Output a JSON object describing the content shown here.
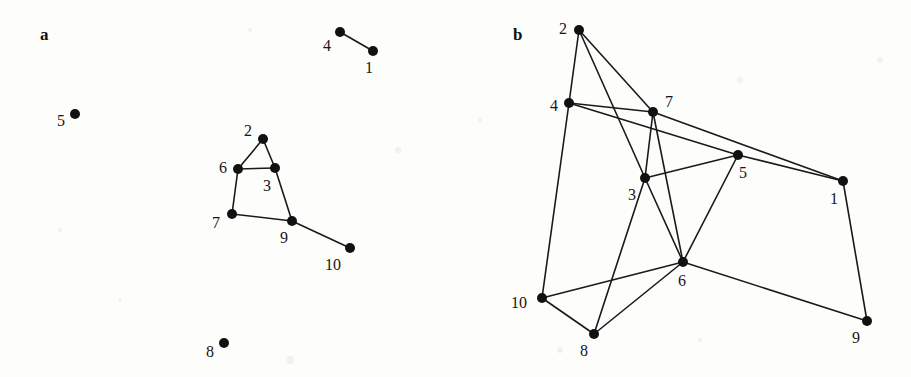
{
  "figure": {
    "width": 911,
    "height": 377,
    "background_color": "#fdfdfc",
    "node_color": "#111111",
    "edge_color": "#1a1a1a",
    "label_color": "#161616",
    "node_radius": 5,
    "edge_width": 1.6
  },
  "panels": [
    {
      "id": "a",
      "letter": "a",
      "letter_pos": [
        40,
        26
      ],
      "nodes": [
        {
          "id": "1",
          "label": "1",
          "x": 373,
          "y": 51,
          "label_x": 369,
          "label_y": 68
        },
        {
          "id": "2",
          "label": "2",
          "x": 263,
          "y": 139,
          "label_x": 248,
          "label_y": 131
        },
        {
          "id": "3",
          "label": "3",
          "x": 275,
          "y": 168,
          "label_x": 267,
          "label_y": 186
        },
        {
          "id": "4",
          "label": "4",
          "x": 340,
          "y": 32,
          "label_x": 327,
          "label_y": 46
        },
        {
          "id": "5",
          "label": "5",
          "x": 75,
          "y": 114,
          "label_x": 61,
          "label_y": 121
        },
        {
          "id": "6",
          "label": "6",
          "x": 238,
          "y": 169,
          "label_x": 223,
          "label_y": 168
        },
        {
          "id": "7",
          "label": "7",
          "x": 232,
          "y": 214,
          "label_x": 216,
          "label_y": 223
        },
        {
          "id": "8",
          "label": "8",
          "x": 224,
          "y": 343,
          "label_x": 210,
          "label_y": 352
        },
        {
          "id": "9",
          "label": "9",
          "x": 292,
          "y": 221,
          "label_x": 284,
          "label_y": 238
        },
        {
          "id": "10",
          "label": "10",
          "x": 350,
          "y": 248,
          "label_x": 333,
          "label_y": 265
        }
      ],
      "edges": [
        [
          "4",
          "1"
        ],
        [
          "2",
          "6"
        ],
        [
          "2",
          "3"
        ],
        [
          "6",
          "3"
        ],
        [
          "6",
          "7"
        ],
        [
          "3",
          "9"
        ],
        [
          "7",
          "9"
        ],
        [
          "9",
          "10"
        ]
      ],
      "isolated_nodes": [
        "5",
        "8"
      ]
    },
    {
      "id": "b",
      "letter": "b",
      "letter_pos": [
        58,
        26
      ],
      "nodes": [
        {
          "id": "1",
          "label": "1",
          "x": 388,
          "y": 181,
          "label_x": 379,
          "label_y": 199
        },
        {
          "id": "2",
          "label": "2",
          "x": 124,
          "y": 30,
          "label_x": 108,
          "label_y": 29
        },
        {
          "id": "3",
          "label": "3",
          "x": 190,
          "y": 178,
          "label_x": 177,
          "label_y": 195
        },
        {
          "id": "4",
          "label": "4",
          "x": 114,
          "y": 103,
          "label_x": 99,
          "label_y": 106
        },
        {
          "id": "5",
          "label": "5",
          "x": 283,
          "y": 155,
          "label_x": 288,
          "label_y": 173
        },
        {
          "id": "6",
          "label": "6",
          "x": 228,
          "y": 262,
          "label_x": 227,
          "label_y": 281
        },
        {
          "id": "7",
          "label": "7",
          "x": 198,
          "y": 112,
          "label_x": 214,
          "label_y": 102
        },
        {
          "id": "8",
          "label": "8",
          "x": 139,
          "y": 334,
          "label_x": 129,
          "label_y": 351
        },
        {
          "id": "9",
          "label": "9",
          "x": 412,
          "y": 321,
          "label_x": 401,
          "label_y": 338
        },
        {
          "id": "10",
          "label": "10",
          "x": 87,
          "y": 298,
          "label_x": 64,
          "label_y": 303
        }
      ],
      "edges": [
        [
          "2",
          "4"
        ],
        [
          "2",
          "7"
        ],
        [
          "2",
          "3"
        ],
        [
          "4",
          "7"
        ],
        [
          "4",
          "5"
        ],
        [
          "4",
          "10"
        ],
        [
          "7",
          "1"
        ],
        [
          "7",
          "3"
        ],
        [
          "7",
          "6"
        ],
        [
          "3",
          "5"
        ],
        [
          "3",
          "8"
        ],
        [
          "3",
          "6"
        ],
        [
          "5",
          "1"
        ],
        [
          "5",
          "6"
        ],
        [
          "1",
          "9"
        ],
        [
          "6",
          "10"
        ],
        [
          "6",
          "8"
        ],
        [
          "6",
          "9"
        ],
        [
          "10",
          "8"
        ]
      ],
      "isolated_nodes": []
    }
  ],
  "chart_data": {
    "type": "scatter",
    "title": "",
    "xlabel": "",
    "ylabel": "",
    "panels": [
      {
        "name": "a",
        "node_labels": [
          "1",
          "2",
          "3",
          "4",
          "5",
          "6",
          "7",
          "8",
          "9",
          "10"
        ],
        "node_count": 10,
        "edge_count": 8,
        "edges": [
          [
            "4",
            "1"
          ],
          [
            "2",
            "6"
          ],
          [
            "2",
            "3"
          ],
          [
            "6",
            "3"
          ],
          [
            "6",
            "7"
          ],
          [
            "3",
            "9"
          ],
          [
            "7",
            "9"
          ],
          [
            "9",
            "10"
          ]
        ],
        "isolated": [
          "5",
          "8"
        ]
      },
      {
        "name": "b",
        "node_labels": [
          "1",
          "2",
          "3",
          "4",
          "5",
          "6",
          "7",
          "8",
          "9",
          "10"
        ],
        "node_count": 10,
        "edge_count": 19,
        "edges": [
          [
            "2",
            "4"
          ],
          [
            "2",
            "7"
          ],
          [
            "2",
            "3"
          ],
          [
            "4",
            "7"
          ],
          [
            "4",
            "5"
          ],
          [
            "4",
            "10"
          ],
          [
            "7",
            "1"
          ],
          [
            "7",
            "3"
          ],
          [
            "7",
            "6"
          ],
          [
            "3",
            "5"
          ],
          [
            "3",
            "8"
          ],
          [
            "3",
            "6"
          ],
          [
            "5",
            "1"
          ],
          [
            "5",
            "6"
          ],
          [
            "1",
            "9"
          ],
          [
            "6",
            "10"
          ],
          [
            "6",
            "8"
          ],
          [
            "6",
            "9"
          ],
          [
            "10",
            "8"
          ]
        ],
        "isolated": []
      }
    ]
  },
  "specks": [
    {
      "x": 250,
      "y": 30,
      "r": 2
    },
    {
      "x": 398,
      "y": 150,
      "r": 3
    },
    {
      "x": 120,
      "y": 300,
      "r": 2
    },
    {
      "x": 290,
      "y": 360,
      "r": 4
    },
    {
      "x": 60,
      "y": 230,
      "r": 2
    },
    {
      "x": 740,
      "y": 80,
      "r": 3
    },
    {
      "x": 480,
      "y": 120,
      "r": 2
    },
    {
      "x": 560,
      "y": 350,
      "r": 3
    },
    {
      "x": 700,
      "y": 340,
      "r": 2
    },
    {
      "x": 880,
      "y": 60,
      "r": 3
    }
  ]
}
